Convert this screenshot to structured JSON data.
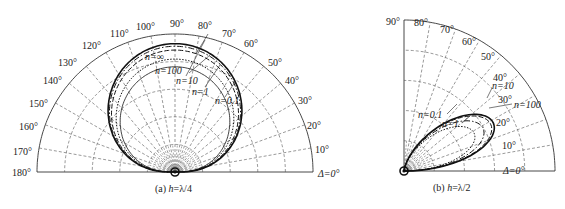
{
  "chart_data": [
    {
      "type": "polar",
      "caption": "(a) h=λ/4",
      "caption_prefix": "(a) ",
      "caption_var": "h",
      "caption_value": "=λ/4",
      "angle_range": [
        0,
        180
      ],
      "angle_ticks": [
        "Δ=0°",
        "10°",
        "20°",
        "30°",
        "40°",
        "50°",
        "60°",
        "70°",
        "80°",
        "90°",
        "100°",
        "110°",
        "120°",
        "130°",
        "140°",
        "150°",
        "160°",
        "170°",
        "180°"
      ],
      "grid": true,
      "series": [
        {
          "name": "n=∞",
          "style": "solid-thick",
          "peak_angle": 90,
          "peak_r": 1.0
        },
        {
          "name": "n=100",
          "style": "dash-dot",
          "peak_angle": 90,
          "peak_r": 0.98
        },
        {
          "name": "n=10",
          "style": "dashed",
          "peak_angle": 90,
          "peak_r": 0.95
        },
        {
          "name": "n=1",
          "style": "dotted",
          "peak_angle": 90,
          "peak_r": 0.88
        },
        {
          "name": "n=0.1",
          "style": "solid-thin",
          "peak_angle": 90,
          "peak_r": 0.82
        }
      ]
    },
    {
      "type": "polar",
      "caption": "(b) h=λ/2",
      "caption_prefix": "(b) ",
      "caption_var": "h",
      "caption_value": "=λ/2",
      "angle_range": [
        0,
        90
      ],
      "angle_ticks": [
        "Δ=0°",
        "10°",
        "20°",
        "30°",
        "40°",
        "50°",
        "60°",
        "70°",
        "80°",
        "90°"
      ],
      "grid": true,
      "series": [
        {
          "name": "n=100",
          "style": "solid-thick",
          "peak_angle": 30,
          "peak_r": 0.7
        },
        {
          "name": "n=10",
          "style": "dashed",
          "peak_angle": 30,
          "peak_r": 0.68
        },
        {
          "name": "n=1",
          "style": "dash-dot",
          "peak_angle": 30,
          "peak_r": 0.62
        },
        {
          "name": "n=0.1",
          "style": "dotted",
          "peak_angle": 30,
          "peak_r": 0.55
        }
      ]
    }
  ],
  "left": {
    "ticks": {
      "a0": "Δ=0°",
      "a10": "10°",
      "a20": "20°",
      "a30": "30°",
      "a40": "40°",
      "a50": "50°",
      "a60": "60°",
      "a70": "70°",
      "a80": "80°",
      "a90": "90°",
      "a100": "100°",
      "a110": "110°",
      "a120": "120°",
      "a130": "130°",
      "a140": "140°",
      "a150": "150°",
      "a160": "160°",
      "a170": "170°",
      "a180": "180°"
    },
    "labels": {
      "ninf": "n=∞",
      "n100": "n=100",
      "n10": "n=10",
      "n1": "n=1",
      "n01": "n=0.1"
    },
    "caption_prefix": "(a) ",
    "caption_var": "h",
    "caption_value": "=λ/4"
  },
  "right": {
    "ticks": {
      "a0": "Δ=0°",
      "a10": "10°",
      "a20": "20°",
      "a30": "30°",
      "a40": "40°",
      "a50": "50°",
      "a60": "60°",
      "a70": "70°",
      "a80": "80°",
      "a90": "90°"
    },
    "labels": {
      "n10": "n=10",
      "n100": "n=100",
      "n01": "n=0.1",
      "n1": "n=1"
    },
    "caption_prefix": "(b) ",
    "caption_var": "h",
    "caption_value": "=λ/2"
  }
}
